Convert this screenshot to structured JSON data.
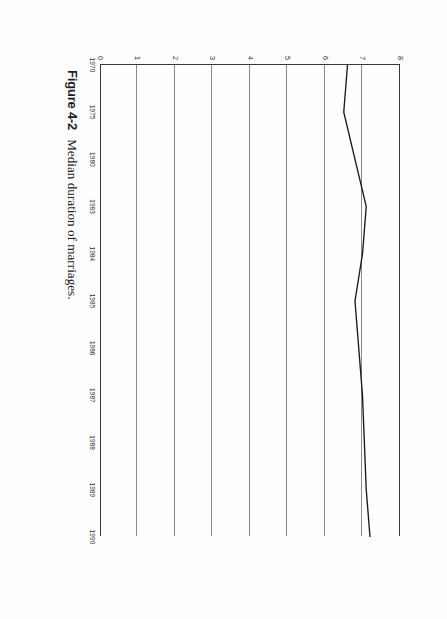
{
  "figure": {
    "label": "Figure 4-2",
    "caption": "Median duration of marriages."
  },
  "chart_data": {
    "type": "line",
    "title": "Median duration of marriages.",
    "xlabel": "",
    "ylabel": "",
    "x": [
      1970,
      1975,
      1980,
      1983,
      1984,
      1985,
      1986,
      1987,
      1988,
      1989,
      1990
    ],
    "xtick_labels": [
      "1970",
      "1975",
      "1980",
      "1983",
      "1984",
      "1985",
      "1986",
      "1987",
      "1988",
      "1989",
      "1990"
    ],
    "values": [
      6.6,
      6.5,
      6.8,
      7.1,
      7.0,
      6.8,
      6.9,
      7.0,
      7.05,
      7.1,
      7.2
    ],
    "ytick_labels": [
      "8",
      "7",
      "6",
      "5",
      "4",
      "3",
      "2",
      "1",
      "0"
    ],
    "yticks": [
      8,
      7,
      6,
      5,
      4,
      3,
      2,
      1,
      0
    ],
    "ylim": [
      0,
      8
    ],
    "xlim": [
      1970,
      1990
    ],
    "grid": "horizontal",
    "legend": null,
    "series_color": "#1a1a1a",
    "grid_color": "#8a8a8a",
    "axis_color": "#3a3a3a",
    "orientation": "rotated-90-clockwise"
  }
}
